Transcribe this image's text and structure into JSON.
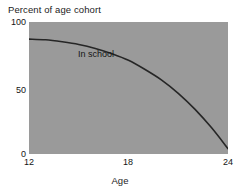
{
  "chart_data": {
    "type": "line",
    "title": "",
    "xlabel": "Age",
    "ylabel": "Percent of age cohort",
    "xlim": [
      12,
      24
    ],
    "ylim": [
      0,
      100
    ],
    "grid": false,
    "legend": "none",
    "plot_background": "#9a9a9a",
    "line_color": "#262626",
    "x_ticks": [
      12,
      18,
      24
    ],
    "x_tick_labels": [
      "12",
      "18",
      "24"
    ],
    "y_ticks": [
      0,
      50,
      100
    ],
    "y_tick_labels": [
      "0",
      "50",
      "100"
    ],
    "annotations": [
      {
        "text": "In school",
        "x": 14.2,
        "y": 92
      }
    ],
    "series": [
      {
        "name": "In school",
        "x": [
          12,
          13,
          14,
          15,
          16,
          17,
          18,
          19,
          20,
          21,
          22,
          23,
          24
        ],
        "values": [
          87,
          86.5,
          85,
          83,
          80,
          76,
          71,
          64,
          56,
          46,
          34,
          20,
          4
        ]
      }
    ]
  },
  "labels": {
    "y_axis_title": "Percent of age cohort",
    "x_axis_title": "Age",
    "y_tick_top": "100",
    "y_tick_mid": "50",
    "y_tick_bottom": "0",
    "x_tick_left": "12",
    "x_tick_mid": "18",
    "x_tick_right": "24",
    "series_label": "In school"
  }
}
